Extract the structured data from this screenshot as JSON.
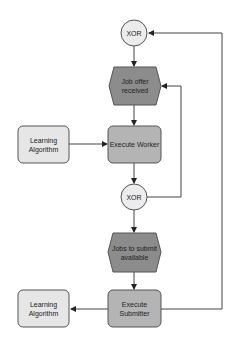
{
  "diagram": {
    "nodes": {
      "xor_top": {
        "label": "XOR",
        "type": "xor-gateway"
      },
      "job_offer": {
        "label": "Job offer received",
        "line1": "Job offer",
        "line2": "received",
        "type": "event"
      },
      "execute_worker": {
        "label": "Execute Worker",
        "type": "function"
      },
      "learning_algorithm_1": {
        "label": "Learning Algorithm",
        "line1": "Learning",
        "line2": "Algorithm",
        "type": "component"
      },
      "xor_mid": {
        "label": "XOR",
        "type": "xor-gateway"
      },
      "jobs_to_submit": {
        "label": "Jobs to submit available",
        "line1": "Jobs to submit",
        "line2": "available",
        "type": "event"
      },
      "execute_submitter": {
        "label": "Execute Submitter",
        "line1": "Execute",
        "line2": "Submitter",
        "type": "function"
      },
      "learning_algorithm_2": {
        "label": "Learning Algorithm",
        "line1": "Learning",
        "line2": "Algorithm",
        "type": "component"
      }
    },
    "edges": [
      {
        "from": "xor_top",
        "to": "job_offer"
      },
      {
        "from": "job_offer",
        "to": "execute_worker"
      },
      {
        "from": "learning_algorithm_1",
        "to": "execute_worker"
      },
      {
        "from": "execute_worker",
        "to": "xor_mid"
      },
      {
        "from": "xor_mid",
        "to": "job_offer"
      },
      {
        "from": "xor_mid",
        "to": "jobs_to_submit"
      },
      {
        "from": "jobs_to_submit",
        "to": "execute_submitter"
      },
      {
        "from": "execute_submitter",
        "to": "learning_algorithm_2"
      },
      {
        "from": "execute_submitter",
        "to": "xor_top"
      }
    ],
    "colors": {
      "event_fill": "#8c8c8c",
      "function_fill": "#b4b4b4",
      "component_fill": "#e6e6e6",
      "xor_fill": "#ececec",
      "stroke": "#555555"
    }
  }
}
